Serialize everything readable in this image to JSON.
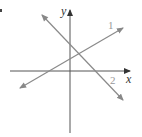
{
  "diagram": {
    "axes": {
      "x_label": "x",
      "y_label": "y",
      "color": "#444444"
    },
    "lines": [
      {
        "label": "1",
        "color": "#888888",
        "from": [
          20,
          88
        ],
        "to": [
          123,
          28
        ],
        "slope": "positive"
      },
      {
        "label": "2",
        "color": "#888888",
        "from": [
          42,
          15
        ],
        "to": [
          123,
          100
        ],
        "slope": "negative"
      }
    ],
    "corner_mark": "•"
  }
}
